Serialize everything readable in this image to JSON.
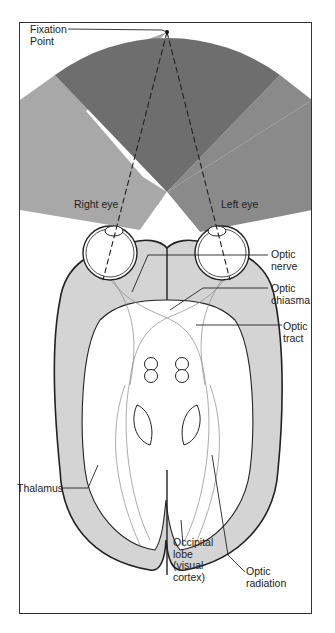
{
  "colors": {
    "central_field": "#6e6e6e",
    "right_eye_field": "#a8a8a8",
    "left_eye_field": "#8a8a8a",
    "brain_fill": "#d4d4d4",
    "outline": "#222222"
  },
  "labels": {
    "fixation_point": "Fixation\nPoint",
    "right_eye": "Right eye",
    "left_eye": "Left eye",
    "optic_nerve": "Optic\nnerve",
    "optic_chiasma": "Optic\nchiasma",
    "optic_tract": "Optic\ntract",
    "thalamus": "Thalamus",
    "occipital_lobe": "Occipital\nlobe\n(visual\ncortex)",
    "optic_radiation": "Optic\nradiation"
  }
}
